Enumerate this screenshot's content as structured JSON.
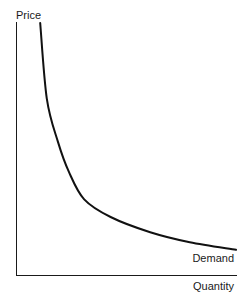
{
  "chart_data": {
    "type": "line",
    "title": "",
    "xlabel": "Quantity",
    "ylabel": "Price",
    "series": [
      {
        "name": "Demand",
        "description": "Downward-sloping convex demand curve (hyperbola-like)",
        "points": [
          {
            "x": 0.11,
            "y": 1.0
          },
          {
            "x": 0.14,
            "y": 0.7
          },
          {
            "x": 0.19,
            "y": 0.53
          },
          {
            "x": 0.24,
            "y": 0.41
          },
          {
            "x": 0.31,
            "y": 0.3
          },
          {
            "x": 0.43,
            "y": 0.23
          },
          {
            "x": 0.61,
            "y": 0.17
          },
          {
            "x": 0.79,
            "y": 0.13
          },
          {
            "x": 1.0,
            "y": 0.1
          }
        ]
      }
    ],
    "xlim": [
      0,
      1
    ],
    "ylim": [
      0,
      1
    ],
    "grid": false,
    "legend": "none",
    "annotations": [
      "Demand"
    ],
    "ticks": "none"
  },
  "labels": {
    "ylabel": "Price",
    "xlabel": "Quantity",
    "series_label": "Demand"
  },
  "colors": {
    "axis": "#1a1a1a",
    "curve": "#111111",
    "background": "#ffffff"
  }
}
